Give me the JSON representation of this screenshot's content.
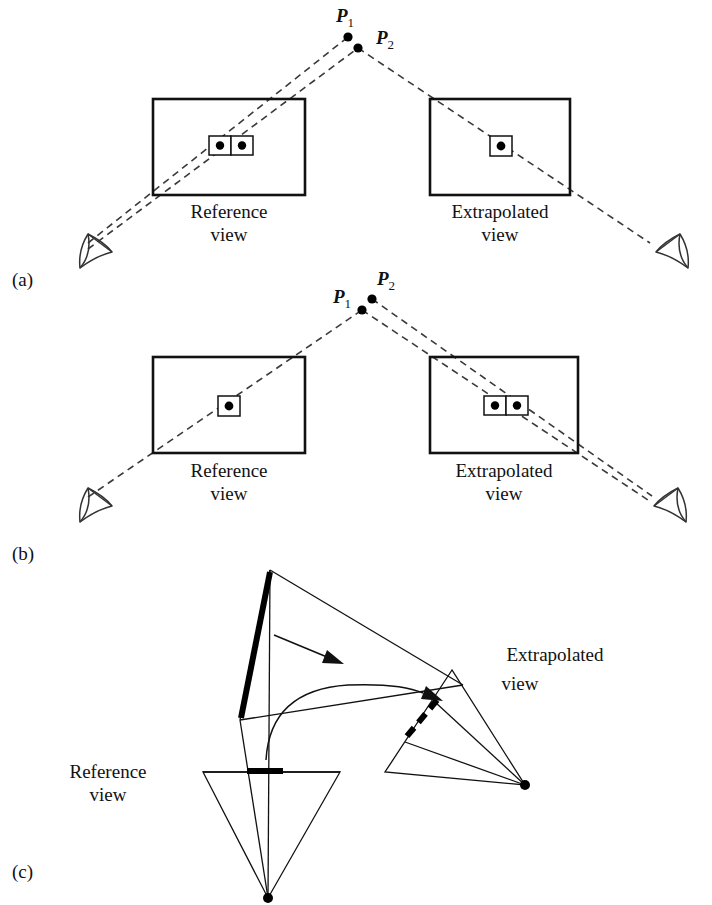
{
  "figure": {
    "panels": [
      {
        "id": "a",
        "label": "(a)",
        "points": [
          {
            "name": "P1",
            "base": "P",
            "sub": "1"
          },
          {
            "name": "P2",
            "base": "P",
            "sub": "2"
          }
        ],
        "views": [
          {
            "id": "reference",
            "line1": "Reference",
            "line2": "view",
            "projected_points": 2
          },
          {
            "id": "extrapolated",
            "line1": "Extrapolated",
            "line2": "view",
            "projected_points": 1
          }
        ]
      },
      {
        "id": "b",
        "label": "(b)",
        "points": [
          {
            "name": "P1",
            "base": "P",
            "sub": "1"
          },
          {
            "name": "P2",
            "base": "P",
            "sub": "2"
          }
        ],
        "views": [
          {
            "id": "reference",
            "line1": "Reference",
            "line2": "view",
            "projected_points": 1
          },
          {
            "id": "extrapolated",
            "line1": "Extrapolated",
            "line2": "view",
            "projected_points": 2
          }
        ]
      },
      {
        "id": "c",
        "label": "(c)",
        "views": [
          {
            "id": "reference",
            "line1": "Reference",
            "line2": "view"
          },
          {
            "id": "extrapolated",
            "line1": "Extrapolated",
            "line2": "view"
          }
        ]
      }
    ]
  },
  "colors": {
    "ink": "#111111",
    "ray": "#3a3a3a",
    "background": "#ffffff"
  }
}
